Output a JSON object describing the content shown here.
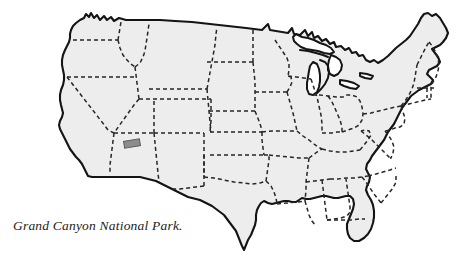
{
  "map": {
    "title": "United States outline map",
    "region": "Contiguous United States",
    "projection_note": "stylized hand-drawn outline",
    "colors": {
      "background": "#ffffff",
      "land_fill": "#ededed",
      "coastline_stroke": "#141414",
      "state_border_stroke": "#262626",
      "lake_fill": "#ffffff",
      "lake_stroke": "#141414",
      "marker_fill": "#8c8c8c",
      "marker_stroke": "#5a5a5a",
      "caption_color": "#1b1b1b"
    },
    "stroke_widths": {
      "coastline": 2.1,
      "state_border": 1.5,
      "lake": 2.0
    },
    "state_border_dash": "4,3",
    "marker": {
      "label": "Grand Canyon National Park",
      "state": "Arizona",
      "shape": "rectangle",
      "x": 124,
      "y": 140,
      "width": 16,
      "height": 7,
      "rotation_deg": -9
    }
  },
  "caption": {
    "text": "Grand Canyon National Park."
  }
}
